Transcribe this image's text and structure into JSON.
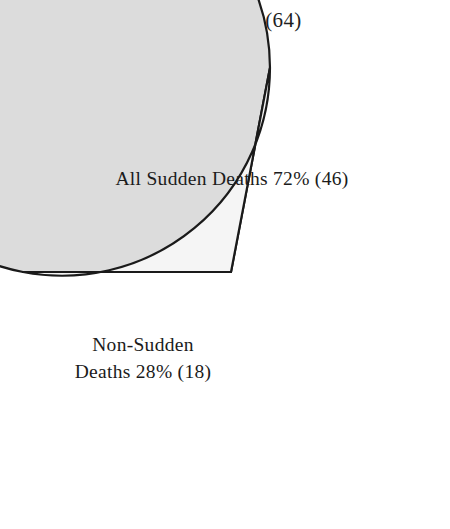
{
  "chart_data": {
    "type": "pie",
    "title": "Total Deaths (64)",
    "total": 64,
    "total_label": "Total Deaths",
    "categories": [
      "All Sudden Deaths",
      "Non-Sudden Deaths"
    ],
    "values": [
      46,
      18
    ],
    "percentages": [
      72,
      28
    ],
    "slice_labels": [
      "All Sudden Deaths 72% (46)",
      "Non-Sudden Deaths 28% (18)"
    ],
    "slices": [
      {
        "name": "All Sudden Deaths",
        "count": 46,
        "percent": 72,
        "label": "All Sudden Deaths 72% (46)",
        "color": "#dcdcdc",
        "start_angle_deg": 180,
        "end_angle_deg": 100.8
      },
      {
        "name": "Non-Sudden Deaths",
        "count": 18,
        "percent": 28,
        "label_line1": "Non-Sudden",
        "label_line2": "Deaths 28% (18)",
        "color": "#f5f5f5",
        "start_angle_deg": 180,
        "end_angle_deg": 280.8
      }
    ],
    "legend": "none",
    "grid": false,
    "xlabel": "",
    "ylabel": "",
    "stroke_color": "#1a1a1a",
    "background": "#ffffff"
  },
  "geometry": {
    "center_x": 231,
    "center_y": 272,
    "radius": 208
  }
}
